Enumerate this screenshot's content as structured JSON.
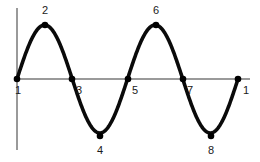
{
  "figure": {
    "background_color": "#ffffff",
    "width": 260,
    "height": 162
  },
  "axes": {
    "axis_color": "#9a9a9a",
    "vertical": {
      "x": 17,
      "y_top": 8,
      "y_bottom": 150
    },
    "horizontal": {
      "y": 79,
      "x_left": 17,
      "x_right": 250
    }
  },
  "curve": {
    "color": "#0a0a0a",
    "stroke_width": 3.6,
    "baseline_y": 79,
    "amplitude_px": 54,
    "cycles": 2,
    "x_start": 17,
    "x_end": 238
  },
  "chart_data": {
    "type": "line",
    "title": "",
    "xlabel": "",
    "ylabel": "",
    "grid": false,
    "legend": null,
    "xlim": [
      0,
      8
    ],
    "ylim": [
      -1,
      1
    ],
    "x": [
      0,
      1,
      2,
      3,
      4,
      5,
      6,
      7,
      8
    ],
    "values": [
      0,
      1,
      0,
      -1,
      0,
      1,
      0,
      -1,
      0
    ],
    "point_labels": [
      "1",
      "2",
      "3",
      "4",
      "5",
      "6",
      "7",
      "8",
      "1"
    ]
  },
  "points": [
    {
      "label": "1",
      "x": 17,
      "y": 79,
      "label_x": 18,
      "label_y": 90,
      "role": "zero-crossing-start"
    },
    {
      "label": "2",
      "x": 45,
      "y": 25,
      "label_x": 45,
      "label_y": 10,
      "role": "crest"
    },
    {
      "label": "3",
      "x": 72,
      "y": 79,
      "label_x": 79,
      "label_y": 90,
      "role": "zero-crossing"
    },
    {
      "label": "4",
      "x": 100,
      "y": 136,
      "label_x": 100,
      "label_y": 150,
      "role": "trough"
    },
    {
      "label": "5",
      "x": 128,
      "y": 79,
      "label_x": 135,
      "label_y": 90,
      "role": "zero-crossing"
    },
    {
      "label": "6",
      "x": 156,
      "y": 25,
      "label_x": 156,
      "label_y": 10,
      "role": "crest"
    },
    {
      "label": "7",
      "x": 183,
      "y": 79,
      "label_x": 190,
      "label_y": 90,
      "role": "zero-crossing"
    },
    {
      "label": "8",
      "x": 211,
      "y": 136,
      "label_x": 211,
      "label_y": 150,
      "role": "trough"
    },
    {
      "label": "1",
      "x": 238,
      "y": 79,
      "label_x": 246,
      "label_y": 90,
      "role": "zero-crossing-end"
    }
  ]
}
